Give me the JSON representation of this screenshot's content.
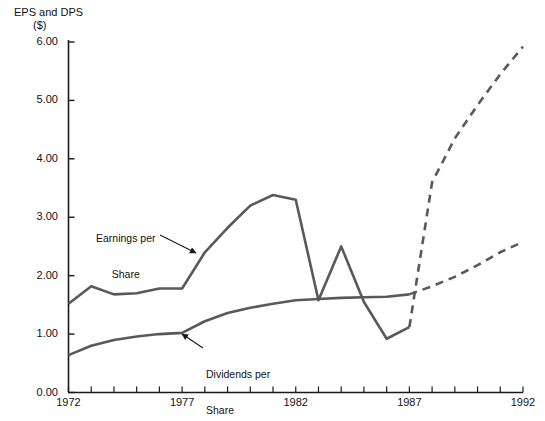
{
  "chart_data": {
    "type": "line",
    "title": "EPS and DPS ($)",
    "title_line1": "EPS and DPS",
    "title_line2": "($)",
    "xlabel": "",
    "ylabel": "EPS and DPS ($)",
    "xlim": [
      1972,
      1992
    ],
    "ylim": [
      0.0,
      6.0
    ],
    "grid": false,
    "legend_position": "inline-annotations",
    "y_ticks": [
      0.0,
      1.0,
      2.0,
      3.0,
      4.0,
      5.0,
      6.0
    ],
    "y_tick_labels": [
      "0.00",
      "1.00",
      "2.00",
      "3.00",
      "4.00",
      "5.00",
      "6.00"
    ],
    "x_ticks": [
      1972,
      1973,
      1974,
      1975,
      1976,
      1977,
      1978,
      1979,
      1980,
      1981,
      1982,
      1983,
      1984,
      1985,
      1986,
      1987,
      1988,
      1989,
      1990,
      1991,
      1992
    ],
    "x_tick_labels_shown": [
      "1972",
      "1977",
      "1982",
      "1987",
      "1992"
    ],
    "x_labeled_years": [
      1972,
      1977,
      1982,
      1987,
      1992
    ],
    "forecast_start_year": 1987,
    "x": [
      1972,
      1973,
      1974,
      1975,
      1976,
      1977,
      1978,
      1979,
      1980,
      1981,
      1982,
      1983,
      1984,
      1985,
      1986,
      1987,
      1988,
      1989,
      1990,
      1991,
      1992
    ],
    "series": [
      {
        "name": "Earnings per Share",
        "short_name": "EPS",
        "color": "#595959",
        "style_historical": "solid",
        "style_forecast": "dashed",
        "values": [
          1.52,
          1.82,
          1.68,
          1.7,
          1.78,
          1.78,
          2.4,
          2.82,
          3.2,
          3.38,
          3.3,
          1.58,
          2.5,
          1.55,
          0.92,
          1.12,
          3.6,
          4.35,
          4.92,
          5.45,
          5.92
        ]
      },
      {
        "name": "Dividends per Share",
        "short_name": "DPS",
        "color": "#595959",
        "style_historical": "solid",
        "style_forecast": "dashed",
        "values": [
          0.64,
          0.8,
          0.9,
          0.96,
          1.0,
          1.02,
          1.22,
          1.36,
          1.45,
          1.52,
          1.58,
          1.6,
          1.62,
          1.63,
          1.64,
          1.68,
          1.82,
          1.98,
          2.18,
          2.4,
          2.58
        ]
      }
    ],
    "annotations": [
      {
        "id": "annot-eps",
        "text_line1": "Earnings per",
        "text_line2": "Share",
        "target_series": "Earnings per Share",
        "arrow_from_x": 160,
        "arrow_from_y": 235,
        "arrow_to_x": 196,
        "arrow_to_y": 253
      },
      {
        "id": "annot-dps",
        "text_line1": "Dividends per",
        "text_line2": "Share",
        "target_series": "Dividends per Share",
        "arrow_from_x": 203,
        "arrow_from_y": 348,
        "arrow_to_x": 182,
        "arrow_to_y": 334
      }
    ]
  },
  "axes": {
    "y_axis_name": "value-axis",
    "x_axis_name": "year-axis"
  }
}
